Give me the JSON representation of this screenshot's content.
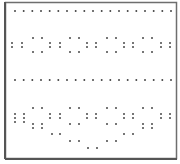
{
  "figure": {
    "colors": {
      "background": "#ffffff",
      "frame": "#6e6e6e",
      "dot": "#2a2a2a"
    },
    "rows": [
      {
        "name": "straight-row-1",
        "kind": "straight",
        "count": 19
      },
      {
        "name": "wavy-band-1",
        "kind": "wavy"
      },
      {
        "name": "straight-row-2",
        "kind": "straight",
        "count": 19
      },
      {
        "name": "wavy-band-2",
        "kind": "wavy-deep"
      }
    ]
  }
}
